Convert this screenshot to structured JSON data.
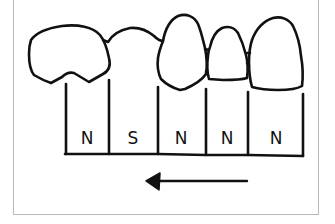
{
  "diagram": {
    "type": "dental arch schematic",
    "teeth_count": 5,
    "columns": [
      {
        "index": 0,
        "label": "N",
        "x_center": 87
      },
      {
        "index": 1,
        "label": "S",
        "x_center": 133
      },
      {
        "index": 2,
        "label": "N",
        "x_center": 181
      },
      {
        "index": 3,
        "label": "N",
        "x_center": 227
      },
      {
        "index": 4,
        "label": "N",
        "x_center": 276
      }
    ],
    "arrow": {
      "direction": "left",
      "icon": "arrow-left-icon"
    },
    "colors": {
      "stroke": "#111111",
      "frame": "#b8b8b8",
      "background": "#ffffff"
    }
  }
}
